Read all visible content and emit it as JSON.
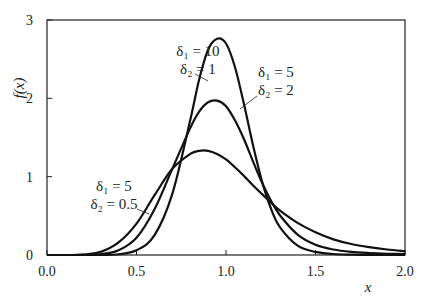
{
  "chart_data": {
    "type": "line",
    "title": "",
    "xlabel": "x",
    "ylabel": "f(x)",
    "xlim": [
      0.0,
      2.0
    ],
    "ylim": [
      0,
      3
    ],
    "xticks": [
      "0.0",
      "0.5",
      "1.0",
      "1.5",
      "2.0"
    ],
    "yticks": [
      "0",
      "1",
      "2",
      "3"
    ],
    "grid": false,
    "legend": "none (inline annotations with arrows)",
    "x": [
      0.0,
      0.1,
      0.2,
      0.3,
      0.4,
      0.5,
      0.6,
      0.7,
      0.8,
      0.85,
      0.9,
      0.95,
      1.0,
      1.05,
      1.1,
      1.15,
      1.2,
      1.25,
      1.3,
      1.4,
      1.5,
      1.6,
      1.7,
      1.8,
      1.9,
      2.0
    ],
    "series": [
      {
        "name": "δ1 = 10, δ2 = 1",
        "label_line1": "δ₁ = 10",
        "label_line2": "δ₂ = 1",
        "values": [
          0,
          0,
          0,
          0.001,
          0.01,
          0.06,
          0.25,
          0.78,
          1.72,
          2.24,
          2.62,
          2.76,
          2.7,
          2.4,
          1.93,
          1.41,
          0.95,
          0.6,
          0.36,
          0.12,
          0.04,
          0.013,
          0.005,
          0.002,
          0.001,
          0.0005
        ]
      },
      {
        "name": "δ1 = 5, δ2 = 2",
        "label_line1": "δ₁ = 5",
        "label_line2": "δ₂ = 2",
        "values": [
          0,
          0,
          0.001,
          0.01,
          0.06,
          0.22,
          0.58,
          1.1,
          1.62,
          1.83,
          1.95,
          1.97,
          1.9,
          1.72,
          1.48,
          1.2,
          0.93,
          0.7,
          0.51,
          0.26,
          0.13,
          0.07,
          0.04,
          0.025,
          0.016,
          0.011
        ]
      },
      {
        "name": "δ1 = 5, δ2 = 0.5",
        "label_line1": "δ₁ = 5",
        "label_line2": "δ₂ = 0.5",
        "values": [
          0,
          0,
          0.004,
          0.04,
          0.16,
          0.4,
          0.76,
          1.1,
          1.29,
          1.33,
          1.33,
          1.29,
          1.22,
          1.12,
          1.01,
          0.89,
          0.78,
          0.67,
          0.57,
          0.41,
          0.29,
          0.2,
          0.14,
          0.1,
          0.07,
          0.05
        ]
      }
    ],
    "annotations": [
      {
        "text": "δ₁ = 10 / δ₂ = 1",
        "arrow_to_x": 0.92,
        "arrow_to_y": 2.3
      },
      {
        "text": "δ₁ = 5 / δ₂ = 2",
        "arrow_to_x": 1.08,
        "arrow_to_y": 1.6
      },
      {
        "text": "δ₁ = 5 / δ₂ = 0.5",
        "arrow_to_x": 0.6,
        "arrow_to_y": 0.78
      }
    ]
  },
  "axes": {
    "xlabel": "x",
    "ylabel": "f(x)",
    "xticks": [
      "0.0",
      "0.5",
      "1.0",
      "1.5",
      "2.0"
    ],
    "yticks": [
      "0",
      "1",
      "2",
      "3"
    ]
  },
  "labels": {
    "s1_a": "δ₁ = 10",
    "s1_b": "δ₂ = 1",
    "s2_a": "δ₁ = 5",
    "s2_b": "δ₂ = 2",
    "s3_a": "δ₁ = 5",
    "s3_b": "δ₂ = 0.5"
  }
}
